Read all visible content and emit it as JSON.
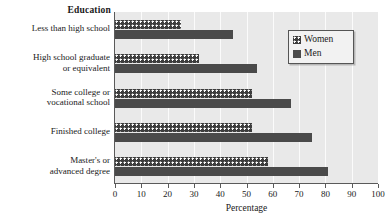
{
  "chart_data": {
    "type": "bar",
    "orientation": "horizontal",
    "title": "Education",
    "xlabel": "Percentage",
    "ylabel": "",
    "xlim": [
      0,
      100
    ],
    "xticks": [
      0,
      10,
      20,
      30,
      40,
      50,
      60,
      70,
      80,
      90,
      100
    ],
    "grid": true,
    "legend_position": "upper right",
    "categories": [
      "Less than high school",
      "High school graduate or equivalent",
      "Some college or vocational school",
      "Finished college",
      "Master's or advanced degree"
    ],
    "category_lines": [
      [
        "Less than high school"
      ],
      [
        "High school graduate",
        "or equivalent"
      ],
      [
        "Some college or",
        "vocational school"
      ],
      [
        "Finished college"
      ],
      [
        "Master's or",
        "advanced degree"
      ]
    ],
    "series": [
      {
        "name": "Women",
        "values": [
          25,
          32,
          52,
          52,
          58
        ]
      },
      {
        "name": "Men",
        "values": [
          45,
          54,
          67,
          75,
          81
        ]
      }
    ]
  },
  "legend": {
    "items": [
      {
        "label": "Women",
        "swatch": "dotted-dark"
      },
      {
        "label": "Men",
        "swatch": "solid-dark"
      }
    ]
  },
  "axis": {
    "tick_labels": [
      "0",
      "10",
      "20",
      "30",
      "40",
      "50",
      "60",
      "70",
      "80",
      "90",
      "100"
    ],
    "title": "Percentage"
  },
  "colors": {
    "plot_background": "#e9e9e9",
    "gridline": "#fbfbfb",
    "bar_men": "#4a4a4a",
    "bar_women": "#3d3d3d",
    "axis": "#5a5a5a",
    "text": "#1a1a1a",
    "legend_background": "#f2f2f2"
  }
}
